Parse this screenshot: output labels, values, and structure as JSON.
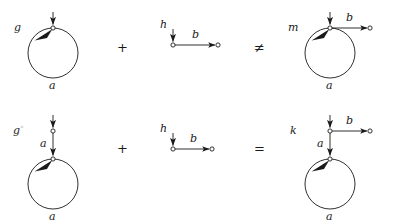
{
  "figure": {
    "background_color": "#ffffff",
    "stroke_color": "#1a1a1a",
    "width": 402,
    "height": 224
  },
  "rows": [
    {
      "id": "row-1",
      "relation_symbol": "≠",
      "operator_symbol": "+",
      "left_diagram": {
        "name": "g-loop",
        "morphism_label": "g",
        "loop_edge_label": "a",
        "input_arrow": true
      },
      "middle_diagram": {
        "name": "h-edge",
        "morphism_label": "h",
        "edge_label": "b",
        "input_arrow": true
      },
      "right_diagram": {
        "name": "m-loop-edge",
        "morphism_label": "m",
        "loop_edge_label": "a",
        "edge_label": "b",
        "input_arrow": true
      }
    },
    {
      "id": "row-2",
      "relation_symbol": "=",
      "operator_symbol": "+",
      "left_diagram": {
        "name": "g-circ-chain",
        "morphism_label": "g",
        "morphism_superscript": "◦",
        "chain_edge_label": "a",
        "loop_edge_label": "a",
        "input_arrow": true
      },
      "middle_diagram": {
        "name": "h-edge",
        "morphism_label": "h",
        "edge_label": "b",
        "input_arrow": true
      },
      "right_diagram": {
        "name": "k-chain-edge",
        "morphism_label": "k",
        "chain_edge_label": "a",
        "loop_edge_label": "a",
        "edge_label": "b",
        "input_arrow": true
      }
    }
  ],
  "labels": {
    "r1_g": "g",
    "r1_a_left": "a",
    "r1_plus": "+",
    "r1_h": "h",
    "r1_b_mid": "b",
    "r1_neq": "≠",
    "r1_m": "m",
    "r1_b_right": "b",
    "r1_a_right": "a",
    "r2_g": "g",
    "r2_g_sup": "◦",
    "r2_a_chain": "a",
    "r2_a_loop": "a",
    "r2_plus": "+",
    "r2_h": "h",
    "r2_b_mid": "b",
    "r2_eq": "=",
    "r2_k": "k",
    "r2_b_right": "b",
    "r2_a_chain_right": "a",
    "r2_a_loop_right": "a"
  }
}
